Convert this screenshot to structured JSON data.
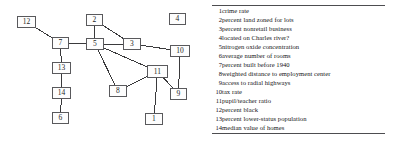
{
  "figure": {
    "title": "",
    "node_stroke": "#59595c",
    "edge_stroke": "#3a3a3c",
    "rule_color": "#4d4d50"
  },
  "graph": {
    "type": "node-link-diagram",
    "nodes": [
      {
        "id": "1",
        "label": "1",
        "x": 145,
        "y": 113,
        "w": 18,
        "h": 12
      },
      {
        "id": "2",
        "label": "2",
        "x": 86,
        "y": 14,
        "w": 17,
        "h": 12
      },
      {
        "id": "3",
        "label": "3",
        "x": 123,
        "y": 38,
        "w": 18,
        "h": 12
      },
      {
        "id": "4",
        "label": "4",
        "x": 169,
        "y": 13,
        "w": 17,
        "h": 12
      },
      {
        "id": "5",
        "label": "5",
        "x": 86,
        "y": 38,
        "w": 18,
        "h": 12
      },
      {
        "id": "6",
        "label": "6",
        "x": 52,
        "y": 112,
        "w": 17,
        "h": 12
      },
      {
        "id": "7",
        "label": "7",
        "x": 52,
        "y": 37,
        "w": 17,
        "h": 12
      },
      {
        "id": "8",
        "label": "8",
        "x": 109,
        "y": 85,
        "w": 18,
        "h": 12
      },
      {
        "id": "9",
        "label": "9",
        "x": 170,
        "y": 88,
        "w": 17,
        "h": 12
      },
      {
        "id": "10",
        "label": "10",
        "x": 170,
        "y": 45,
        "w": 20,
        "h": 12
      },
      {
        "id": "11",
        "label": "11",
        "x": 147,
        "y": 65,
        "w": 21,
        "h": 13
      },
      {
        "id": "12",
        "label": "12",
        "x": 17,
        "y": 16,
        "w": 19,
        "h": 12
      },
      {
        "id": "13",
        "label": "13",
        "x": 52,
        "y": 62,
        "w": 19,
        "h": 12
      },
      {
        "id": "14",
        "label": "14",
        "x": 52,
        "y": 87,
        "w": 19,
        "h": 12
      }
    ],
    "edges": [
      {
        "from": "12",
        "to": "7"
      },
      {
        "from": "7",
        "to": "5"
      },
      {
        "from": "7",
        "to": "13"
      },
      {
        "from": "13",
        "to": "14"
      },
      {
        "from": "14",
        "to": "6"
      },
      {
        "from": "2",
        "to": "5"
      },
      {
        "from": "2",
        "to": "3"
      },
      {
        "from": "5",
        "to": "3"
      },
      {
        "from": "5",
        "to": "8"
      },
      {
        "from": "5",
        "to": "11"
      },
      {
        "from": "3",
        "to": "10"
      },
      {
        "from": "10",
        "to": "9"
      },
      {
        "from": "8",
        "to": "11"
      },
      {
        "from": "11",
        "to": "9"
      },
      {
        "from": "11",
        "to": "1"
      }
    ],
    "isolated_nodes": [
      "4"
    ]
  },
  "legend": {
    "rows": [
      {
        "index": "1",
        "description": "crime rate"
      },
      {
        "index": "2",
        "description": "percent land zoned for lots"
      },
      {
        "index": "3",
        "description": "percent nonretail business"
      },
      {
        "index": "4",
        "description": "located on Charles river?"
      },
      {
        "index": "5",
        "description": "nitrogen oxide concentration"
      },
      {
        "index": "6",
        "description": "average number of rooms"
      },
      {
        "index": "7",
        "description": "percent built before 1940"
      },
      {
        "index": "8",
        "description": "weighted distance to employment center"
      },
      {
        "index": "9",
        "description": "access to radial highways"
      },
      {
        "index": "10",
        "description": "tax rate"
      },
      {
        "index": "11",
        "description": "pupil/teacher ratio"
      },
      {
        "index": "12",
        "description": "percent black"
      },
      {
        "index": "13",
        "description": "percent lower-status population"
      },
      {
        "index": "14",
        "description": "median value of homes"
      }
    ]
  }
}
